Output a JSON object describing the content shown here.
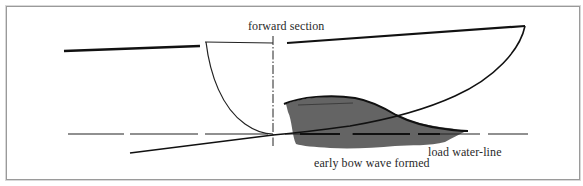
{
  "diagram": {
    "labels": {
      "forward_section": "forward section",
      "bow_wave": "early bow wave formed",
      "load_water_line": "load water-line"
    },
    "elements": [
      {
        "name": "sheer-line",
        "style": "thick solid"
      },
      {
        "name": "forward-section-curve",
        "style": "thin solid"
      },
      {
        "name": "section-centerline",
        "style": "dash-dot vertical"
      },
      {
        "name": "bow-profile-and-keel",
        "style": "solid"
      },
      {
        "name": "load-water-line",
        "style": "long dashes"
      },
      {
        "name": "bow-wave",
        "style": "grey filled shape"
      }
    ],
    "colors": {
      "line": "#111111",
      "wave_fill": "#5a5a5a",
      "frame": "#9a9a9a",
      "background": "#ffffff",
      "text": "#2a2a2a"
    }
  }
}
